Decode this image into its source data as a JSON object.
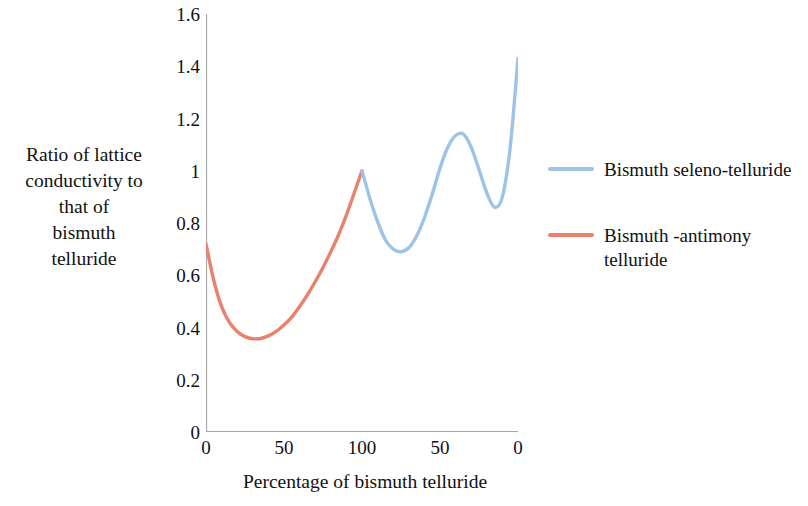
{
  "chart_data": {
    "type": "line",
    "title": "",
    "xlabel": "Percentage of bismuth telluride",
    "ylabel": "Ratio of lattice conductivity to that of bismuth telluride",
    "ylabel_lines": [
      "Ratio of lattice",
      "conductivity to",
      "that of",
      "bismuth",
      "telluride"
    ],
    "xlim": [
      0,
      200
    ],
    "ylim": [
      0,
      1.6
    ],
    "grid": false,
    "legend_position": "right",
    "x_tick_positions": [
      0,
      50,
      100,
      150,
      200
    ],
    "x_tick_labels": [
      "0",
      "50",
      "100",
      "50",
      "0"
    ],
    "y_tick_values": [
      0,
      0.2,
      0.4,
      0.6,
      0.8,
      1,
      1.2,
      1.4,
      1.6
    ],
    "y_tick_labels": [
      "0",
      "0.2",
      "0.4",
      "0.6",
      "0.8",
      "1",
      "1.2",
      "1.4",
      "1.6"
    ],
    "series": [
      {
        "name": "Bismuth -antimony telluride",
        "name_lines": [
          "Bismuth -antimony",
          "telluride"
        ],
        "color": "#E8826E",
        "x": [
          0,
          5,
          10,
          15,
          20,
          25,
          30,
          35,
          40,
          45,
          50,
          55,
          60,
          65,
          70,
          75,
          80,
          85,
          90,
          95,
          100
        ],
        "y": [
          0.72,
          0.58,
          0.48,
          0.42,
          0.385,
          0.365,
          0.357,
          0.358,
          0.368,
          0.385,
          0.41,
          0.44,
          0.48,
          0.525,
          0.575,
          0.63,
          0.69,
          0.755,
          0.83,
          0.915,
          1.0
        ]
      },
      {
        "name": "Bismuth seleno-telluride",
        "name_lines": [
          "Bismuth seleno-telluride"
        ],
        "color": "#9DC3E6",
        "x": [
          100,
          105,
          110,
          115,
          120,
          125,
          130,
          135,
          140,
          145,
          150,
          155,
          160,
          165,
          170,
          175,
          180,
          185,
          190,
          195,
          200
        ],
        "y": [
          1.0,
          0.895,
          0.805,
          0.735,
          0.7,
          0.69,
          0.705,
          0.75,
          0.82,
          0.91,
          1.01,
          1.09,
          1.135,
          1.14,
          1.09,
          1.005,
          0.915,
          0.86,
          0.9,
          1.09,
          1.43
        ]
      }
    ]
  },
  "legend": {
    "entries": [
      {
        "label": "Bismuth seleno-telluride",
        "color": "#9DC3E6"
      },
      {
        "label": "Bismuth -antimony telluride",
        "color": "#E8826E"
      }
    ]
  },
  "axis": {
    "line_color": "#A6A6A6"
  }
}
